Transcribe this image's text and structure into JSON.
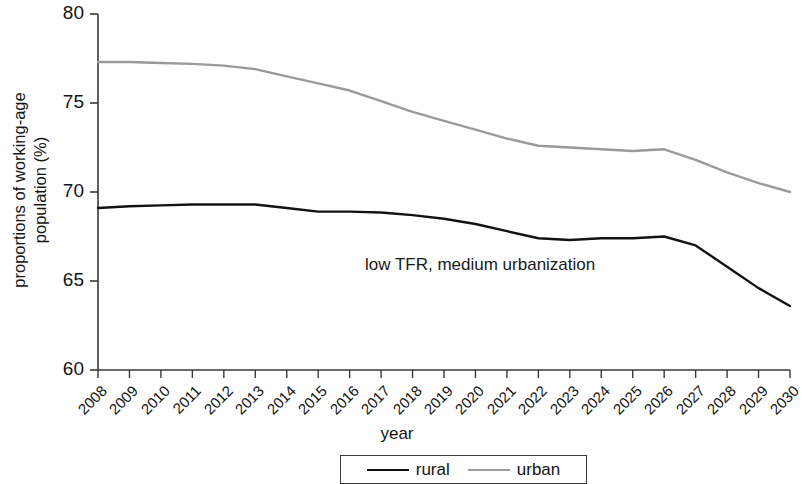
{
  "chart_data": {
    "type": "line",
    "title": "",
    "xlabel": "year",
    "ylabel": "proportions of working-age population (%)",
    "ylabel_line1": "proportions of working-age",
    "ylabel_line2": "population (%)",
    "annotation": "low TFR, medium urbanization",
    "legend_position": "bottom",
    "grid": false,
    "ylim": [
      60,
      80
    ],
    "yticks": [
      60,
      65,
      70,
      75,
      80
    ],
    "categories": [
      "2008",
      "2009",
      "2010",
      "2011",
      "2012",
      "2013",
      "2014",
      "2015",
      "2016",
      "2017",
      "2018",
      "2019",
      "2020",
      "2021",
      "2022",
      "2023",
      "2024",
      "2025",
      "2026",
      "2027",
      "2028",
      "2029",
      "2030"
    ],
    "series": [
      {
        "name": "rural",
        "color": "#121212",
        "values": [
          69.1,
          69.2,
          69.25,
          69.3,
          69.3,
          69.3,
          69.1,
          68.9,
          68.9,
          68.85,
          68.7,
          68.5,
          68.2,
          67.8,
          67.4,
          67.3,
          67.4,
          67.4,
          67.5,
          67.0,
          65.8,
          64.6,
          63.6
        ]
      },
      {
        "name": "urban",
        "color": "#9a9a9a",
        "values": [
          77.3,
          77.3,
          77.25,
          77.2,
          77.1,
          76.9,
          76.5,
          76.1,
          75.7,
          75.1,
          74.5,
          74.0,
          73.5,
          73.0,
          72.6,
          72.5,
          72.4,
          72.3,
          72.4,
          71.8,
          71.1,
          70.5,
          70.0
        ]
      }
    ]
  },
  "legend": {
    "entries": [
      {
        "label": "rural"
      },
      {
        "label": "urban"
      }
    ]
  },
  "axis": {
    "x_title": "year",
    "y_title_line1": "proportions of working-age",
    "y_title_line2": "population (%)"
  }
}
